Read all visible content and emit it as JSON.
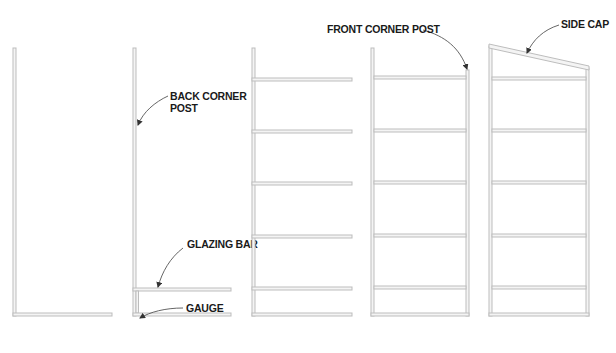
{
  "diagram": {
    "colors": {
      "background": "#ffffff",
      "member_fill": "#f4f4f4",
      "member_stroke": "#bdbdbd",
      "label_text": "#1a1a1a",
      "leader_line": "#555555"
    },
    "stages": [
      {
        "id": "stage-1",
        "description": "Back corner post with bottom rail"
      },
      {
        "id": "stage-2",
        "description": "Glazing bar added with gauge"
      },
      {
        "id": "stage-3",
        "description": "All glazing bars installed"
      },
      {
        "id": "stage-4",
        "description": "Front corner post added"
      },
      {
        "id": "stage-5",
        "description": "Side cap installed"
      }
    ],
    "callouts": {
      "back_corner_post_line1": "BACK CORNER",
      "back_corner_post_line2": "POST",
      "glazing_bar": "GLAZING BAR",
      "gauge": "GAUGE",
      "front_corner_post": "FRONT CORNER POST",
      "side_cap": "SIDE CAP"
    }
  }
}
